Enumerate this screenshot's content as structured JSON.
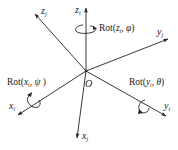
{
  "diagram": {
    "origin": {
      "label": "O",
      "x": 86,
      "y": 71
    },
    "axes": [
      {
        "id": "z_i",
        "base": "z",
        "sub": "i",
        "end": [
          86,
          8
        ],
        "label_pos": [
          74,
          6
        ]
      },
      {
        "id": "z_j",
        "base": "z",
        "sub": "j",
        "end": [
          35,
          14
        ],
        "label_pos": [
          41,
          5
        ]
      },
      {
        "id": "y_j",
        "base": "y",
        "sub": "j",
        "end": [
          168,
          39
        ],
        "label_pos": [
          157,
          26
        ]
      },
      {
        "id": "y_i",
        "base": "y",
        "sub": "i",
        "end": [
          166,
          116
        ],
        "label_pos": [
          164,
          100
        ]
      },
      {
        "id": "x_i",
        "base": "x",
        "sub": "i",
        "end": [
          18,
          115
        ],
        "label_pos": [
          8,
          100
        ]
      },
      {
        "id": "x_j",
        "base": "x",
        "sub": "j",
        "end": [
          77,
          138
        ],
        "label_pos": [
          82,
          130
        ]
      }
    ],
    "rotations": [
      {
        "id": "rot-z",
        "prefix": "Rot(",
        "axis": "z",
        "sub": "i",
        "angle": "φ",
        "label_pos": [
          99,
          24
        ]
      },
      {
        "id": "rot-x",
        "prefix": "Rot(",
        "axis": "x",
        "sub": "i",
        "angle": "ψ",
        "label_pos": [
          7,
          78
        ]
      },
      {
        "id": "rot-y",
        "prefix": "Rot(",
        "axis": "y",
        "sub": "i",
        "angle": "θ",
        "label_pos": [
          129,
          78
        ]
      }
    ],
    "stroke_color": "#222222"
  },
  "labels": {
    "origin": "O",
    "z_i": {
      "base": "z",
      "sub": "i"
    },
    "z_j": {
      "base": "z",
      "sub": "j"
    },
    "y_j": {
      "base": "y",
      "sub": "j"
    },
    "y_i": {
      "base": "y",
      "sub": "i"
    },
    "x_i": {
      "base": "x",
      "sub": "i"
    },
    "x_j": {
      "base": "x",
      "sub": "j"
    },
    "rot_z": {
      "prefix": "Rot(",
      "axis": "z",
      "sub": "i",
      "sep": ", ",
      "angle": "φ",
      "close": ")"
    },
    "rot_x": {
      "prefix": "Rot(",
      "axis": "x",
      "sub": "i",
      "sep": ", ",
      "angle": "ψ",
      "close": " )"
    },
    "rot_y": {
      "prefix": "Rot(",
      "axis": "y",
      "sub": "i",
      "sep": ", ",
      "angle": "θ",
      "close": ")"
    }
  }
}
